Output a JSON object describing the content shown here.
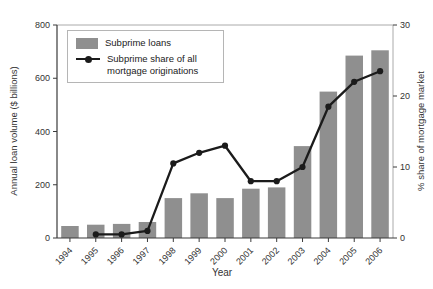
{
  "chart_data": {
    "type": "bar",
    "combo": "bar+line",
    "title": "",
    "xlabel": "Year",
    "categories": [
      "1994",
      "1995",
      "1996",
      "1997",
      "1998",
      "1999",
      "2000",
      "2001",
      "2002",
      "2003",
      "2004",
      "2005",
      "2006"
    ],
    "series": [
      {
        "name": "Subprime loans",
        "type": "bar",
        "axis": "left",
        "values": [
          45,
          50,
          53,
          60,
          150,
          168,
          150,
          185,
          190,
          345,
          550,
          685,
          705
        ]
      },
      {
        "name": "Subprime share of all mortgage originations",
        "type": "line",
        "axis": "right",
        "marker": "circle",
        "values": [
          null,
          0.5,
          0.5,
          1,
          10.5,
          12,
          13,
          8,
          8,
          10,
          18.5,
          22,
          23.5
        ]
      }
    ],
    "left_axis": {
      "label": "Annual loan volume ($ billions)",
      "min": 0,
      "max": 800,
      "ticks": [
        0,
        200,
        400,
        600,
        800
      ]
    },
    "right_axis": {
      "label": "% share of mortgage market",
      "min": 0,
      "max": 30,
      "ticks": [
        0,
        10,
        20,
        30
      ]
    },
    "grid": false,
    "legend": {
      "position": "top-left",
      "items": [
        {
          "label": "Subprime loans",
          "swatch": "bar"
        },
        {
          "label": "Subprime share of all mortgage originations",
          "swatch": "line-marker"
        }
      ]
    }
  },
  "colors": {
    "bar": "#8f8f8f",
    "line": "#1b1b1b",
    "marker": "#1b1b1b",
    "axis": "#3a3a3a",
    "frame": "#aaaaaa",
    "tick_text": "#333333",
    "legend_border": "#b5b5b5"
  }
}
